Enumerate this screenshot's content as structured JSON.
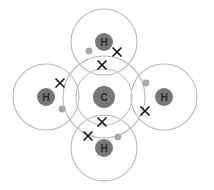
{
  "diagram": {
    "molecule": "CH4",
    "canvas": {
      "width": 214,
      "height": 190,
      "background": "#ffffff"
    },
    "colors": {
      "shell_stroke": "#b9b9b9",
      "nucleus_fill": "#777777",
      "nucleus_label": "#2a2a2a",
      "electron_dot": "#a8a8a8",
      "electron_cross": "#1a1a1a"
    },
    "atoms": [
      {
        "id": "carbon-center",
        "symbol": "C",
        "role": "central-atom",
        "cx": 104,
        "cy": 97,
        "nucleus_r": 11,
        "shells": [
          {
            "name": "carbon-inner-shell",
            "r": 28
          },
          {
            "name": "carbon-outer-shell",
            "r": 41
          }
        ]
      },
      {
        "id": "hydrogen-top",
        "symbol": "H",
        "role": "bonded-atom",
        "cx": 104,
        "cy": 42,
        "nucleus_r": 9,
        "shells": [
          {
            "name": "hydrogen-top-shell",
            "r": 33
          }
        ]
      },
      {
        "id": "hydrogen-left",
        "symbol": "H",
        "role": "bonded-atom",
        "cx": 46,
        "cy": 97,
        "nucleus_r": 9,
        "shells": [
          {
            "name": "hydrogen-left-shell",
            "r": 33
          }
        ]
      },
      {
        "id": "hydrogen-right",
        "symbol": "H",
        "role": "bonded-atom",
        "cx": 164,
        "cy": 97,
        "nucleus_r": 9,
        "shells": [
          {
            "name": "hydrogen-right-shell",
            "r": 33
          }
        ]
      },
      {
        "id": "hydrogen-bottom",
        "symbol": "H",
        "role": "bonded-atom",
        "cx": 104,
        "cy": 148,
        "nucleus_r": 9,
        "shells": [
          {
            "name": "hydrogen-bottom-shell",
            "r": 33
          }
        ]
      }
    ],
    "bonding_pairs": [
      {
        "id": "bond-pair-top",
        "bond": "C-H top",
        "dot": {
          "owner": "carbon",
          "cx": 89,
          "cy": 51,
          "r": 3.4
        },
        "cross": {
          "owner": "hydrogen",
          "cx": 117,
          "cy": 52,
          "size": 4.0
        }
      },
      {
        "id": "bond-pair-left",
        "bond": "C-H left",
        "dot": {
          "owner": "carbon",
          "cx": 62,
          "cy": 109,
          "r": 3.4
        },
        "cross": {
          "owner": "hydrogen",
          "cx": 60,
          "cy": 83,
          "size": 4.0
        }
      },
      {
        "id": "bond-pair-right",
        "bond": "C-H right",
        "dot": {
          "owner": "carbon",
          "cx": 146,
          "cy": 83,
          "r": 3.4
        },
        "cross": {
          "owner": "hydrogen",
          "cx": 145,
          "cy": 111,
          "size": 4.0
        }
      },
      {
        "id": "bond-pair-bottom",
        "bond": "C-H bottom",
        "dot": {
          "owner": "carbon",
          "cx": 118,
          "cy": 137,
          "r": 3.4
        },
        "cross": {
          "owner": "hydrogen",
          "cx": 88,
          "cy": 136,
          "size": 4.0
        }
      }
    ],
    "carbon_shell_crosses": [
      {
        "id": "carbon-cross-top",
        "cx": 102,
        "cy": 65,
        "size": 4.0
      },
      {
        "id": "carbon-cross-bottom",
        "cx": 102,
        "cy": 122,
        "size": 4.0
      }
    ]
  }
}
